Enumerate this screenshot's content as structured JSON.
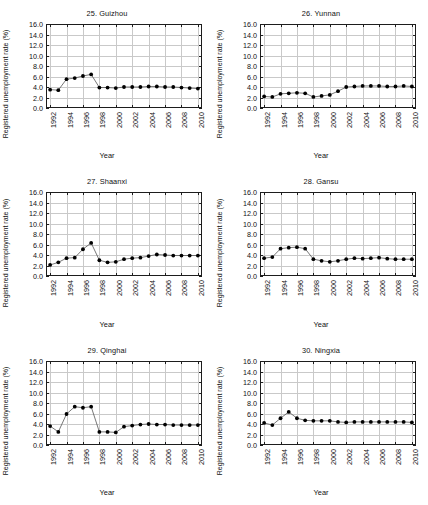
{
  "figure": {
    "layout": "2 columns x 3 rows small multiples",
    "panel_count": 6
  },
  "axes": {
    "ylabel": "Registered unemployment rate (%)",
    "xlabel": "Year",
    "ytick_labels": [
      "0.0",
      "2.0",
      "4.0",
      "6.0",
      "8.0",
      "10.0",
      "12.0",
      "14.0",
      "16.0"
    ],
    "ytick_values": [
      0,
      2,
      4,
      6,
      8,
      10,
      12,
      14,
      16
    ],
    "xtick_labels": [
      "1992",
      "1994",
      "1996",
      "1998",
      "2000",
      "2002",
      "2004",
      "2006",
      "2008",
      "2010"
    ],
    "xtick_values": [
      1992,
      1994,
      1996,
      1998,
      2000,
      2002,
      2004,
      2006,
      2008,
      2010
    ],
    "ylim": [
      0,
      16
    ],
    "xlim": [
      1991.5,
      2010.5
    ],
    "grid": true,
    "marker_color": "#000000",
    "line_color": "#555555",
    "grid_color": "#c9c9c9",
    "frame_color": "#1d1d1d"
  },
  "chart_data": [
    {
      "type": "line",
      "title": "25. Guizhou",
      "xlabel": "Year",
      "ylabel": "Registered unemployment rate (%)",
      "ylim": [
        0,
        16
      ],
      "x": [
        1992,
        1993,
        1994,
        1995,
        1996,
        1997,
        1998,
        1999,
        2000,
        2001,
        2002,
        2003,
        2004,
        2005,
        2006,
        2007,
        2008,
        2009,
        2010
      ],
      "values": [
        3.5,
        3.4,
        5.5,
        5.7,
        6.1,
        6.4,
        3.9,
        3.9,
        3.8,
        4.0,
        4.0,
        4.0,
        4.1,
        4.1,
        4.0,
        4.0,
        3.9,
        3.8,
        3.7
      ]
    },
    {
      "type": "line",
      "title": "26. Yunnan",
      "xlabel": "Year",
      "ylabel": "Registered unemployment rate (%)",
      "ylim": [
        0,
        16
      ],
      "x": [
        1992,
        1993,
        1994,
        1995,
        1996,
        1997,
        1998,
        1999,
        2000,
        2001,
        2002,
        2003,
        2004,
        2005,
        2006,
        2007,
        2008,
        2009,
        2010
      ],
      "values": [
        2.2,
        2.1,
        2.7,
        2.8,
        2.9,
        2.8,
        2.1,
        2.3,
        2.5,
        3.2,
        4.0,
        4.1,
        4.2,
        4.2,
        4.2,
        4.1,
        4.1,
        4.2,
        4.1
      ]
    },
    {
      "type": "line",
      "title": "27. Shaanxi",
      "xlabel": "Year",
      "ylabel": "Registered unemployment rate (%)",
      "ylim": [
        0,
        16
      ],
      "x": [
        1992,
        1993,
        1994,
        1995,
        1996,
        1997,
        1998,
        1999,
        2000,
        2001,
        2002,
        2003,
        2004,
        2005,
        2006,
        2007,
        2008,
        2009,
        2010
      ],
      "values": [
        2.1,
        2.6,
        3.4,
        3.5,
        5.1,
        6.3,
        3.0,
        2.6,
        2.7,
        3.2,
        3.4,
        3.5,
        3.8,
        4.1,
        4.0,
        3.9,
        3.9,
        3.9,
        3.9
      ]
    },
    {
      "type": "line",
      "title": "28. Gansu",
      "xlabel": "Year",
      "ylabel": "Registered unemployment rate (%)",
      "ylim": [
        0,
        16
      ],
      "x": [
        1992,
        1993,
        1994,
        1995,
        1996,
        1997,
        1998,
        1999,
        2000,
        2001,
        2002,
        2003,
        2004,
        2005,
        2006,
        2007,
        2008,
        2009,
        2010
      ],
      "values": [
        3.4,
        3.6,
        5.2,
        5.4,
        5.5,
        5.2,
        3.2,
        2.9,
        2.7,
        2.9,
        3.2,
        3.4,
        3.3,
        3.4,
        3.5,
        3.3,
        3.2,
        3.2,
        3.2
      ]
    },
    {
      "type": "line",
      "title": "29. Qinghai",
      "xlabel": "Year",
      "ylabel": "Registered unemployment rate (%)",
      "ylim": [
        0,
        16
      ],
      "x": [
        1992,
        1993,
        1994,
        1995,
        1996,
        1997,
        1998,
        1999,
        2000,
        2001,
        2002,
        2003,
        2004,
        2005,
        2006,
        2007,
        2008,
        2009,
        2010
      ],
      "values": [
        3.6,
        2.5,
        5.9,
        7.3,
        7.1,
        7.3,
        2.5,
        2.5,
        2.4,
        3.5,
        3.7,
        3.9,
        4.0,
        3.9,
        3.9,
        3.8,
        3.8,
        3.8,
        3.8
      ]
    },
    {
      "type": "line",
      "title": "30. Ningxia",
      "xlabel": "Year",
      "ylabel": "Registered unemployment rate (%)",
      "ylim": [
        0,
        16
      ],
      "x": [
        1992,
        1993,
        1994,
        1995,
        1996,
        1997,
        1998,
        1999,
        2000,
        2001,
        2002,
        2003,
        2004,
        2005,
        2006,
        2007,
        2008,
        2009,
        2010
      ],
      "values": [
        4.2,
        3.8,
        5.1,
        6.3,
        5.1,
        4.7,
        4.6,
        4.6,
        4.6,
        4.4,
        4.3,
        4.4,
        4.4,
        4.4,
        4.4,
        4.4,
        4.4,
        4.4,
        4.3
      ]
    }
  ]
}
